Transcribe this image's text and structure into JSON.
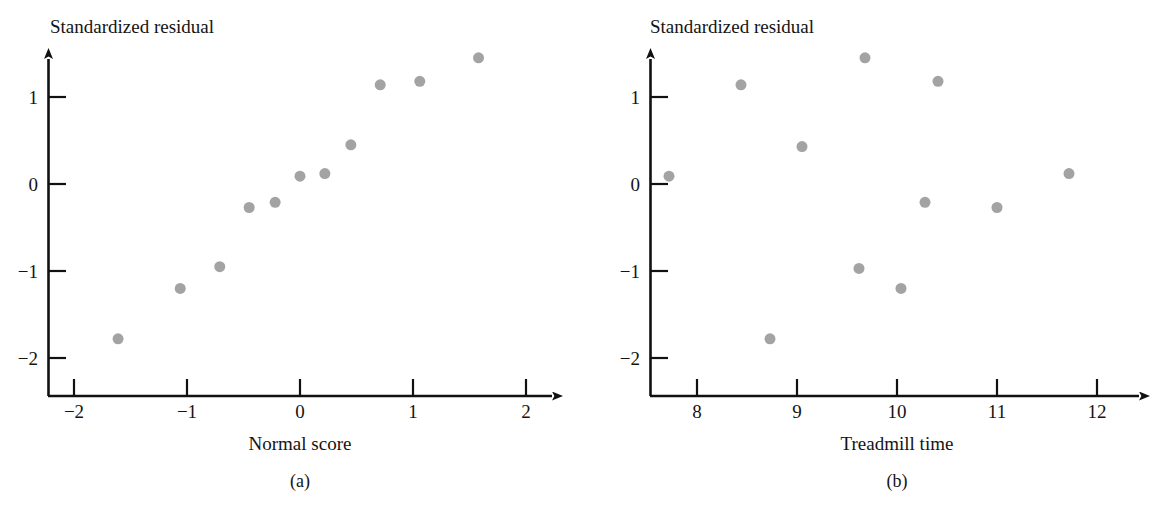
{
  "figure": {
    "background": "#ffffff",
    "axis_color": "#111111",
    "point_color": "#a3a3a3",
    "point_radius": 5.5
  },
  "panels": [
    {
      "id": "a",
      "caption": "(a)",
      "x_axis_title": "Normal score",
      "y_axis_title": "Standardized residual",
      "x_ticks": [
        "−2",
        "−1",
        "0",
        "1",
        "2"
      ],
      "y_ticks": [
        "1",
        "0",
        "−1",
        "−2"
      ]
    },
    {
      "id": "b",
      "caption": "(b)",
      "x_axis_title": "Treadmill time",
      "y_axis_title": "Standardized residual",
      "x_ticks": [
        "8",
        "9",
        "10",
        "11",
        "12"
      ],
      "y_ticks": [
        "1",
        "0",
        "−1",
        "−2"
      ]
    }
  ],
  "chart_data": [
    {
      "type": "scatter",
      "panel": "a",
      "title": "",
      "xlabel": "Normal score",
      "ylabel": "Standardized residual",
      "xlim": [
        -2.45,
        2.35
      ],
      "ylim": [
        -2.45,
        1.65
      ],
      "xticks": [
        -2,
        -1,
        0,
        1,
        2
      ],
      "yticks": [
        1,
        0,
        -1,
        -2
      ],
      "grid": false,
      "legend": null,
      "x": [
        -1.61,
        -1.06,
        -0.71,
        -0.45,
        -0.22,
        0.0,
        0.22,
        0.45,
        0.71,
        1.06,
        1.58
      ],
      "y": [
        -1.78,
        -1.2,
        -0.95,
        -0.27,
        -0.21,
        0.09,
        0.12,
        0.45,
        1.14,
        1.18,
        1.45
      ]
    },
    {
      "type": "scatter",
      "panel": "b",
      "title": "",
      "xlabel": "Treadmill time",
      "ylabel": "Standardized residual",
      "xlim": [
        7.5,
        12.35
      ],
      "ylim": [
        -2.45,
        1.65
      ],
      "xticks": [
        8,
        9,
        10,
        11,
        12
      ],
      "yticks": [
        1,
        0,
        -1,
        -2
      ],
      "grid": false,
      "legend": null,
      "x": [
        7.72,
        8.44,
        8.73,
        9.05,
        9.62,
        9.68,
        10.04,
        10.28,
        10.41,
        11.0,
        11.72
      ],
      "y": [
        0.09,
        1.14,
        -1.78,
        0.43,
        -0.97,
        1.45,
        -1.2,
        -0.21,
        1.18,
        -0.27,
        0.12
      ]
    }
  ]
}
